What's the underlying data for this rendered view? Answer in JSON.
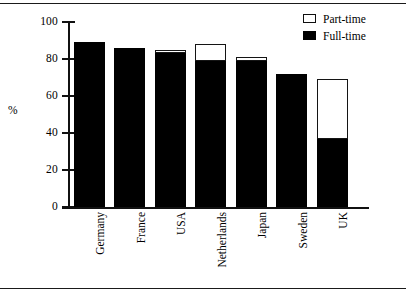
{
  "page": {
    "background_color": "#ffffff",
    "rule_color": "#1a1a1a"
  },
  "legend": {
    "position": "top-right",
    "entries": [
      {
        "label": "Part-time",
        "swatch": "hollow-square",
        "color": "#ffffff",
        "icon_name": "part-time-swatch-icon"
      },
      {
        "label": "Full-time",
        "swatch": "filled-square",
        "color": "#000000",
        "icon_name": "full-time-swatch-icon"
      }
    ]
  },
  "axes": {
    "y_title": "%",
    "y_ticks": [
      "0",
      "20",
      "40",
      "60",
      "80",
      "100"
    ],
    "y_tick_values": [
      0,
      20,
      40,
      60,
      80,
      100
    ],
    "x_labels": [
      "Germany",
      "France",
      "USA",
      "Netherlands",
      "Japan",
      "Sweden",
      "UK"
    ]
  },
  "chart_data": {
    "type": "bar",
    "subtype": "stacked-bar",
    "title": "",
    "subtitle": "",
    "xlabel": "",
    "ylabel": "%",
    "ylim": [
      0,
      100
    ],
    "yticks": [
      0,
      20,
      40,
      60,
      80,
      100
    ],
    "grid": false,
    "legend_position": "top-right",
    "orientation": "vertical",
    "categories": [
      "Germany",
      "France",
      "USA",
      "Netherlands",
      "Japan",
      "Sweden",
      "UK"
    ],
    "series": [
      {
        "name": "Full-time",
        "color": "#000000",
        "values": [
          89,
          86,
          83,
          79,
          79,
          72,
          37
        ]
      },
      {
        "name": "Part-time",
        "color": "#ffffff",
        "values": [
          0,
          0,
          2,
          9,
          2,
          0,
          32
        ]
      }
    ],
    "totals": [
      89,
      86,
      85,
      88,
      81,
      72,
      69
    ],
    "units": "percent"
  }
}
